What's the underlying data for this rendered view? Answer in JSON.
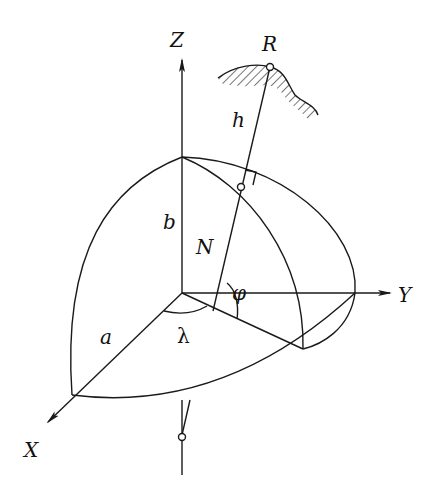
{
  "diagram": {
    "labels": {
      "z_axis": "Z",
      "y_axis": "Y",
      "x_axis": "X",
      "point": "R",
      "height": "h",
      "normal": "N",
      "semi_minor": "b",
      "semi_major": "a",
      "latitude": "φ",
      "longitude": "λ"
    },
    "colors": {
      "ink": "#1a1a1a",
      "background": "#ffffff"
    }
  }
}
